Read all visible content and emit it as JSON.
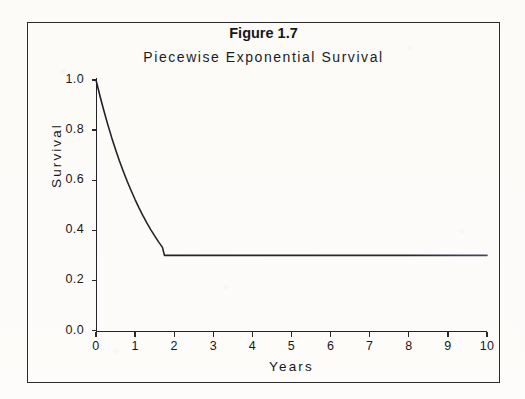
{
  "figure": {
    "title": "Figure 1.7",
    "subtitle": "Piecewise Exponential Survival"
  },
  "chart_data": {
    "type": "line",
    "title": "Piecewise Exponential Survival",
    "figure_label": "Figure 1.7",
    "xlabel": "Years",
    "ylabel": "Survival",
    "xlim": [
      0,
      10
    ],
    "ylim": [
      0.0,
      1.0
    ],
    "grid": false,
    "legend": null,
    "xticks": [
      0,
      1,
      2,
      3,
      4,
      5,
      6,
      7,
      8,
      9,
      10
    ],
    "xticklabels": [
      "0",
      "1",
      "2",
      "3",
      "4",
      "5",
      "6",
      "7",
      "8",
      "9",
      "10"
    ],
    "yticks": [
      0.0,
      0.2,
      0.4,
      0.6,
      0.8,
      1.0
    ],
    "yticklabels": [
      "0.0",
      "0.2",
      "0.4",
      "0.6",
      "0.8",
      "1.0"
    ],
    "series": [
      {
        "name": "Survival",
        "color": "#232327",
        "linewidth": 1.6,
        "changepoint_years": 1.75,
        "plateau_value": 0.3,
        "x": [
          0.0,
          0.1,
          0.2,
          0.3,
          0.4,
          0.5,
          0.6,
          0.7,
          0.8,
          0.9,
          1.0,
          1.1,
          1.2,
          1.3,
          1.4,
          1.5,
          1.6,
          1.7,
          1.75,
          2.0,
          3.0,
          4.0,
          5.0,
          6.0,
          7.0,
          8.0,
          9.0,
          10.0
        ],
        "y": [
          1.0,
          0.937,
          0.878,
          0.823,
          0.771,
          0.723,
          0.677,
          0.635,
          0.595,
          0.558,
          0.523,
          0.49,
          0.459,
          0.43,
          0.403,
          0.378,
          0.354,
          0.332,
          0.3,
          0.3,
          0.3,
          0.3,
          0.3,
          0.3,
          0.3,
          0.3,
          0.3,
          0.3
        ]
      }
    ],
    "baseline_artifact": {
      "name": "zero-baseline-scan-line",
      "value": 0.0,
      "colors": [
        "#b96f4a",
        "#6f8fa8",
        "#4c6f8c",
        "#5b5b63"
      ]
    }
  }
}
